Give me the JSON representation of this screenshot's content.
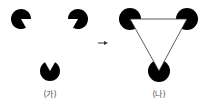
{
  "figure": {
    "panels": [
      {
        "id": "ga",
        "label": "(가)",
        "label_pos": [
          50,
          88
        ],
        "pacmen": [
          {
            "cx": 21,
            "cy": 19,
            "r": 10,
            "mouth_start": 0,
            "mouth_end": 60
          },
          {
            "cx": 78,
            "cy": 19,
            "r": 10,
            "mouth_start": 120,
            "mouth_end": 180
          },
          {
            "cx": 50,
            "cy": 71,
            "r": 10,
            "mouth_start": 240,
            "mouth_end": 300
          }
        ]
      },
      {
        "id": "na",
        "label": "(나)",
        "label_pos": [
          159,
          88
        ],
        "circles": [
          {
            "cx": 130,
            "cy": 19,
            "r": 11
          },
          {
            "cx": 187,
            "cy": 19,
            "r": 11
          },
          {
            "cx": 159,
            "cy": 71,
            "r": 11
          }
        ],
        "triangle": [
          [
            130,
            19
          ],
          [
            187,
            19
          ],
          [
            159,
            71
          ]
        ]
      }
    ],
    "arrow": {
      "x1": 98,
      "y1": 43,
      "x2": 108,
      "y2": 43
    },
    "colors": {
      "shape": "#000000",
      "background": "#ffffff",
      "label": "#555555",
      "line": "#333333"
    }
  }
}
